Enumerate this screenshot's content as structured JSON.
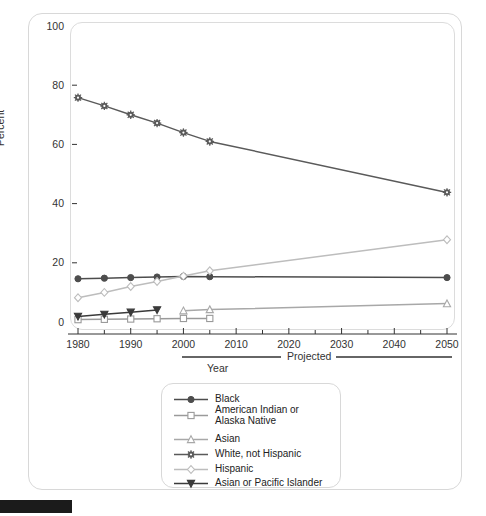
{
  "chart_data": {
    "type": "line",
    "title": "",
    "xlabel": "Year",
    "ylabel": "Percent",
    "xlim": [
      1980,
      2050
    ],
    "ylim": [
      0,
      100
    ],
    "ytick_labels": [
      "0",
      "20",
      "40",
      "60",
      "80",
      "100"
    ],
    "ytick_values": [
      0,
      20,
      40,
      60,
      80,
      100
    ],
    "xtick_labels": [
      "1980",
      "1990",
      "2000",
      "2010",
      "2020",
      "2030",
      "2040",
      "2050"
    ],
    "xtick_values": [
      1980,
      1990,
      2000,
      2010,
      2020,
      2030,
      2040,
      2050
    ],
    "xminor_values": [
      1985,
      1995,
      2005,
      2015,
      2025,
      2035,
      2045
    ],
    "grid": false,
    "legend_position": "below-center",
    "annotations": [
      {
        "name": "projected-bracket",
        "text": "Projected",
        "from_year": 2005,
        "to_year": 2050
      },
      {
        "name": "year-bracket",
        "text": "Year"
      }
    ],
    "series": [
      {
        "name": "Black",
        "marker": "circle",
        "color": "#4d4d4d",
        "x": [
          1980,
          1985,
          1990,
          1995,
          2000,
          2005,
          2050
        ],
        "values": [
          14.6,
          14.8,
          15.0,
          15.2,
          15.4,
          15.3,
          15.0
        ]
      },
      {
        "name": "American Indian or\nAlaska Native",
        "marker": "square",
        "color": "#9a9a9a",
        "x": [
          1980,
          1985,
          1990,
          1995,
          2000,
          2005
        ],
        "values": [
          0.8,
          0.9,
          1.0,
          1.1,
          1.2,
          1.2
        ]
      },
      {
        "name": "Asian",
        "marker": "triangle-up",
        "color": "#a8a8a8",
        "x": [
          2000,
          2005,
          2050
        ],
        "values": [
          3.8,
          4.2,
          6.2
        ]
      },
      {
        "name": "White, not Hispanic",
        "marker": "asterisk",
        "color": "#5a5a5a",
        "x": [
          1980,
          1985,
          1990,
          1995,
          2000,
          2005,
          2050
        ],
        "values": [
          75.8,
          73.0,
          70.0,
          67.2,
          64.0,
          61.0,
          43.8
        ]
      },
      {
        "name": "Hispanic",
        "marker": "diamond",
        "color": "#bdbdbd",
        "x": [
          1980,
          1985,
          1990,
          1995,
          2000,
          2005,
          2050
        ],
        "values": [
          8.2,
          10.0,
          12.0,
          13.7,
          15.5,
          17.3,
          27.8
        ]
      },
      {
        "name": "Asian or Pacific Islander",
        "marker": "triangle-down",
        "color": "#3a3a3a",
        "x": [
          1980,
          1985,
          1990,
          1995
        ],
        "values": [
          1.9,
          2.6,
          3.3,
          4.1
        ]
      }
    ]
  },
  "legend": {
    "items": [
      {
        "label": "Black"
      },
      {
        "label": "American Indian or\nAlaska Native"
      },
      {
        "label": "Asian"
      },
      {
        "label": "White, not Hispanic"
      },
      {
        "label": "Hispanic"
      },
      {
        "label": "Asian or Pacific Islander"
      }
    ]
  },
  "colors": {
    "axis": "#333333",
    "frame": "#d8d8d8",
    "plot_frame": "#dcdcdc",
    "background": "#ffffff",
    "bottom_bar": "#1b1b1b"
  }
}
